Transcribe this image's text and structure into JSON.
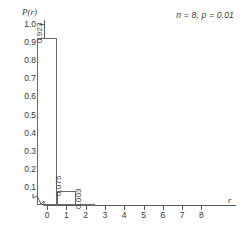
{
  "chart_data": {
    "type": "bar",
    "title": "",
    "subtitle": "",
    "annotation": "n = 8, p = 0.01",
    "xlabel": "r",
    "ylabel": "P(r)",
    "categories": [
      "0",
      "1",
      "2",
      "3",
      "4",
      "5",
      "6",
      "7",
      "8"
    ],
    "values": [
      0.923,
      0.075,
      0.003,
      0.0,
      0.0,
      0.0,
      0.0,
      0.0,
      0.0
    ],
    "bar_labels": [
      "0.923",
      "0.075",
      "0.003",
      "",
      "",
      "",
      "",
      "",
      ""
    ],
    "xlim": [
      0,
      8
    ],
    "ylim": [
      0,
      1.0
    ],
    "yticks": [
      "1.0",
      "0.9",
      "0.8",
      "0.7",
      "0.6",
      "0.5",
      "0.4",
      "0.3",
      "0.2",
      "0.1"
    ],
    "ytick_values": [
      1.0,
      0.9,
      0.8,
      0.7,
      0.6,
      0.5,
      0.4,
      0.3,
      0.2,
      0.1
    ],
    "xticks": [
      "0",
      "1",
      "2",
      "3",
      "4",
      "5",
      "6",
      "7",
      "8"
    ],
    "grid": false,
    "legend": false,
    "axis_break": "y-axis break near origin",
    "colors": {
      "bar_fill": "#ffffff",
      "bar_stroke": "#6a6a6a",
      "axis": "#5a5a5a",
      "text": "#3a3a3a",
      "background": "#ffffff"
    }
  }
}
